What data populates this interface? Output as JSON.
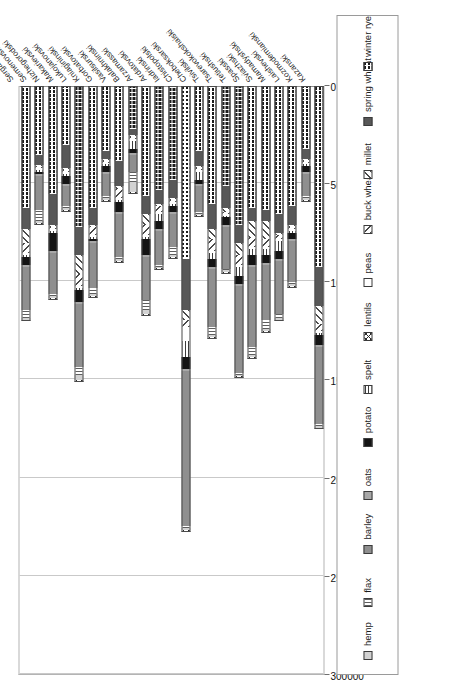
{
  "chart_data": {
    "type": "bar",
    "orientation": "horizontal-stacked",
    "title": "",
    "xlabel": "",
    "ylabel": "",
    "xlim": [
      0,
      300000
    ],
    "tick_labels": [
      "300000",
      "250000",
      "200000",
      "150000",
      "100000",
      "50000",
      "0"
    ],
    "tick_values": [
      300000,
      250000,
      200000,
      150000,
      100000,
      50000,
      0
    ],
    "grid": true,
    "legend_position": "bottom-outside",
    "categories": [
      "Sergachski",
      "Semenovski",
      "Nizhegorodski",
      "Makarievski",
      "Lukojanovski",
      "Kniagininski",
      "Gorbatovski",
      "Vasilsurski",
      "Balakhninski",
      "Arzamasski",
      "Ardatovski",
      "Iadrinski",
      "Chistopolski",
      "Cheboksarski",
      "Tsivilski",
      "Tsarevokokshaiski",
      "Tetiushski",
      "Spasski",
      "Sviazhski",
      "Mamadyshski",
      "Laishevski",
      "Kozmodemianski",
      "Kazanski"
    ],
    "series": [
      {
        "name": "winter rye",
        "key": "winterrye",
        "values": [
          62000,
          35000,
          55000,
          30000,
          72000,
          62000,
          33000,
          38000,
          22000,
          56000,
          53000,
          48000,
          88000,
          33000,
          60000,
          51000,
          71000,
          62000,
          63000,
          65000,
          61000,
          32000,
          92000
        ]
      },
      {
        "name": "spring wheat",
        "key": "springwheat",
        "values": [
          11000,
          5000,
          16000,
          12000,
          14000,
          9000,
          4000,
          13000,
          3000,
          9000,
          7000,
          9000,
          26000,
          8000,
          13000,
          11000,
          9000,
          7000,
          6000,
          10000,
          10000,
          5000,
          20000
        ]
      },
      {
        "name": "millet",
        "key": "millet",
        "values": [
          7000,
          1000,
          1000,
          1000,
          10000,
          1000,
          1000,
          1000,
          1000,
          6000,
          1000,
          1000,
          5000,
          1000,
          5000,
          2000,
          6000,
          8000,
          9000,
          1000,
          1000,
          1000,
          9000
        ]
      },
      {
        "name": "buck wheat",
        "key": "buckwheat",
        "values": [
          5000,
          1000,
          1000,
          1000,
          6000,
          4000,
          1000,
          5000,
          1000,
          5000,
          3000,
          1000,
          4000,
          1000,
          6000,
          1000,
          5000,
          5000,
          4000,
          2000,
          1000,
          1000,
          4000
        ]
      },
      {
        "name": "peas",
        "key": "peas",
        "values": [
          1000,
          1000,
          1000,
          1000,
          1000,
          1000,
          1000,
          1000,
          1000,
          1000,
          1000,
          1000,
          7000,
          1000,
          1000,
          1000,
          1000,
          1000,
          1000,
          1000,
          1000,
          1000,
          1000
        ]
      },
      {
        "name": "spelt",
        "key": "spelt",
        "values": [
          1000,
          1000,
          1000,
          1000,
          1000,
          1000,
          1000,
          1000,
          4000,
          1000,
          4000,
          1000,
          8000,
          4000,
          3000,
          1000,
          5000,
          3000,
          3000,
          5000,
          1000,
          1000,
          1000
        ]
      },
      {
        "name": "potato",
        "key": "potato",
        "values": [
          4000,
          1000,
          9000,
          4000,
          6000,
          1000,
          3000,
          5000,
          2000,
          8000,
          4000,
          3000,
          6000,
          2000,
          4000,
          4000,
          4000,
          5000,
          4000,
          4000,
          3000,
          3000,
          5000
        ]
      },
      {
        "name": "oats",
        "key": "oats",
        "values": [
          1000,
          1000,
          1000,
          1000,
          1000,
          1000,
          1000,
          1000,
          1000,
          1000,
          1000,
          1000,
          1000,
          1000,
          1000,
          1000,
          1000,
          1000,
          1000,
          1000,
          1000,
          1000,
          1000
        ]
      },
      {
        "name": "barley",
        "key": "barley",
        "values": [
          22000,
          17000,
          21000,
          10000,
          32000,
          23000,
          11000,
          22000,
          9000,
          22000,
          17000,
          17000,
          79000,
          13000,
          30000,
          21000,
          44000,
          41000,
          28000,
          27000,
          21000,
          11000,
          39000
        ]
      },
      {
        "name": "flax",
        "key": "flax",
        "values": [
          4000,
          6000,
          1000,
          1000,
          4000,
          3000,
          1000,
          1000,
          5000,
          5000,
          1000,
          4000,
          1000,
          1000,
          4000,
          1000,
          1000,
          4000,
          5000,
          2000,
          1000,
          1000,
          1000
        ]
      },
      {
        "name": "hemp",
        "key": "hemp",
        "values": [
          1000,
          1000,
          1000,
          1000,
          3000,
          1000,
          1000,
          1000,
          5000,
          2000,
          1000,
          1000,
          1000,
          1000,
          1000,
          1000,
          1000,
          1000,
          1000,
          1000,
          1000,
          1000,
          1000
        ]
      },
      {
        "name": "lentils",
        "key": "lentils",
        "values": [
          1000,
          1000,
          1000,
          1000,
          1000,
          1000,
          1000,
          1000,
          1000,
          1000,
          1000,
          1000,
          1000,
          1000,
          1000,
          1000,
          1000,
          1000,
          1000,
          1000,
          1000,
          1000,
          1000
        ]
      }
    ],
    "totals": [
      120000,
      70000,
      108000,
      63000,
      151000,
      107000,
      58000,
      88000,
      55000,
      116000,
      94000,
      87000,
      227000,
      66000,
      128000,
      95000,
      148000,
      138000,
      126000,
      119000,
      102000,
      58000,
      174000
    ]
  },
  "legend": {
    "items": [
      {
        "label": "hemp",
        "key": "hemp"
      },
      {
        "label": "flax",
        "key": "flax"
      },
      {
        "label": "barley",
        "key": "barley"
      },
      {
        "label": "oats",
        "key": "oats"
      },
      {
        "label": "potato",
        "key": "potato"
      },
      {
        "label": "spelt",
        "key": "spelt"
      },
      {
        "label": "lentils",
        "key": "lentils"
      },
      {
        "label": "peas",
        "key": "peas"
      },
      {
        "label": "buck wheat",
        "key": "buckwheat"
      },
      {
        "label": "millet",
        "key": "millet"
      },
      {
        "label": "spring wheat",
        "key": "springwheat"
      },
      {
        "label": "winter rye",
        "key": "winterrye"
      }
    ]
  },
  "colors": {
    "plot_border": "#b4b4b4",
    "grid": "#c9c9c9",
    "axis": "#8d8d8d",
    "text": "#1a1a1a",
    "background": "#ffffff"
  }
}
